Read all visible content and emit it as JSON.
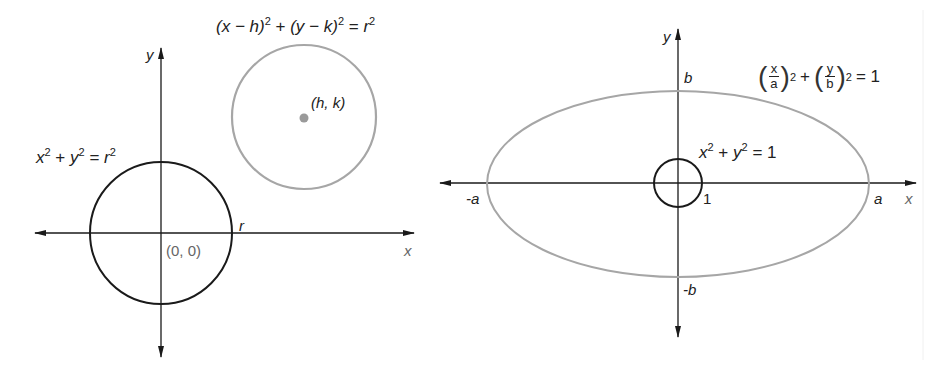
{
  "figure": {
    "colors": {
      "axis": "#1a1a1a",
      "black_curve": "#1a1a1a",
      "gray_curve": "#a6a6a6",
      "gray_dot": "#9a9a9a",
      "label_text": "#222222",
      "point_label_text": "#666666"
    }
  },
  "left_diagram": {
    "axis_labels": {
      "x": "x",
      "y": "y"
    },
    "origin_circle": {
      "equation": {
        "a": "x",
        "a_exp": "2",
        "plus": "+",
        "b": "y",
        "b_exp": "2",
        "equals": "=",
        "c": "r",
        "c_exp": "2"
      },
      "center_label": "(0, 0)",
      "radius_label": "r"
    },
    "shifted_circle": {
      "equation": {
        "p1": "(x − h)",
        "p1_exp": "2",
        "plus": "+",
        "p2": "(y − k)",
        "p2_exp": "2",
        "equals": "=",
        "rhs": "r",
        "rhs_exp": "2"
      },
      "center_label": "(h, k)"
    }
  },
  "right_diagram": {
    "axis_labels": {
      "x": "x",
      "y": "y"
    },
    "tick_labels": {
      "neg_a": "-a",
      "a": "a",
      "b": "b",
      "neg_b": "-b",
      "one": "1"
    },
    "unit_circle": {
      "equation": {
        "a": "x",
        "a_exp": "2",
        "plus": "+",
        "b": "y",
        "b_exp": "2",
        "equals": "=",
        "rhs": "1"
      }
    },
    "ellipse": {
      "equation": {
        "f1_num": "x",
        "f1_den": "a",
        "f1_exp": "2",
        "plus": "+",
        "f2_num": "y",
        "f2_den": "b",
        "f2_exp": "2",
        "equals": "= 1"
      }
    }
  }
}
